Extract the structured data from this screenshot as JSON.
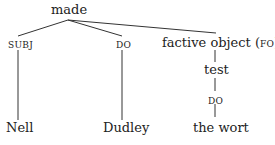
{
  "diagram": {
    "type": "dependency-tree",
    "root": {
      "label": "made"
    },
    "branches": [
      {
        "relation": "SUBJ",
        "child": "Nell"
      },
      {
        "relation": "DO",
        "child": "Dudley"
      },
      {
        "relation_prefix": "factive object (",
        "relation_abbrev": "FO",
        "relation_suffix": ")",
        "child": "test",
        "sub": {
          "relation": "DO",
          "child": "the wort"
        }
      }
    ],
    "line_color": "#333333"
  }
}
